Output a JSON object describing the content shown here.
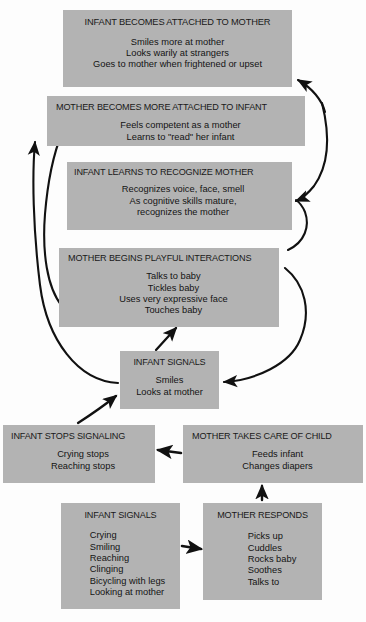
{
  "diagram": {
    "box_fill": "#b3b3b3",
    "arrow_color": "#111111",
    "background": "#fdfdfd",
    "boxes": [
      {
        "id": "attached-mother",
        "title": "INFANT BECOMES ATTACHED TO MOTHER",
        "lines": [
          "Smiles more at mother",
          "Looks warily at strangers",
          "Goes to mother when frightened or upset"
        ]
      },
      {
        "id": "mother-attached",
        "title": "MOTHER BECOMES MORE ATTACHED TO INFANT",
        "lines": [
          "Feels competent as a mother",
          "Learns to \"read\" her infant"
        ]
      },
      {
        "id": "recognize-mother",
        "title": "INFANT LEARNS TO RECOGNIZE MOTHER",
        "lines": [
          "Recognizes voice, face, smell",
          "As cognitive skills mature,",
          "recognizes the mother"
        ]
      },
      {
        "id": "playful",
        "title": "MOTHER BEGINS PLAYFUL INTERACTIONS",
        "lines": [
          "Talks to baby",
          "Tickles baby",
          "Uses very expressive face",
          "Touches baby"
        ]
      },
      {
        "id": "signals-mid",
        "title": "INFANT SIGNALS",
        "lines": [
          "Smiles",
          "Looks at mother"
        ]
      },
      {
        "id": "stops-signaling",
        "title": "INFANT STOPS SIGNALING",
        "lines": [
          "Crying stops",
          "Reaching stops"
        ]
      },
      {
        "id": "takes-care",
        "title": "MOTHER TAKES CARE OF CHILD",
        "lines": [
          "Feeds infant",
          "Changes diapers"
        ]
      },
      {
        "id": "signals-bottom",
        "title": "INFANT SIGNALS",
        "lines": [
          "Crying",
          "Smiling",
          "Reaching",
          "Clinging",
          "Bicycling with legs",
          "Looking at mother"
        ]
      },
      {
        "id": "mother-responds",
        "title": "MOTHER RESPONDS",
        "lines": [
          "Picks up",
          "Cuddles",
          "Rocks baby",
          "Soothes",
          "Talks to"
        ]
      }
    ],
    "arrows": [
      {
        "id": "signals-to-mother-attached",
        "from": "signals-mid",
        "to": "mother-attached",
        "style": "curved"
      },
      {
        "id": "playful-to-attached-mother",
        "from": "playful",
        "to": "attached-mother",
        "style": "curved"
      },
      {
        "id": "attached-mother-to-recognize",
        "from": "attached-mother",
        "to": "recognize-mother",
        "style": "curved"
      },
      {
        "id": "playful-to-recognize",
        "from": "playful",
        "to": "recognize-mother",
        "style": "curved"
      },
      {
        "id": "signals-to-playful-right",
        "from": "signals-mid",
        "to": "playful",
        "style": "curved"
      },
      {
        "id": "signals-to-playful-up",
        "from": "signals-mid",
        "to": "playful",
        "style": "straight"
      },
      {
        "id": "stops-to-signals",
        "from": "stops-signaling",
        "to": "signals-mid",
        "style": "curved"
      },
      {
        "id": "takes-care-to-stops",
        "from": "takes-care",
        "to": "stops-signaling",
        "style": "straight"
      },
      {
        "id": "responds-to-takes-care",
        "from": "mother-responds",
        "to": "takes-care",
        "style": "straight"
      },
      {
        "id": "signals-bottom-to-responds",
        "from": "signals-bottom",
        "to": "mother-responds",
        "style": "straight"
      }
    ]
  }
}
